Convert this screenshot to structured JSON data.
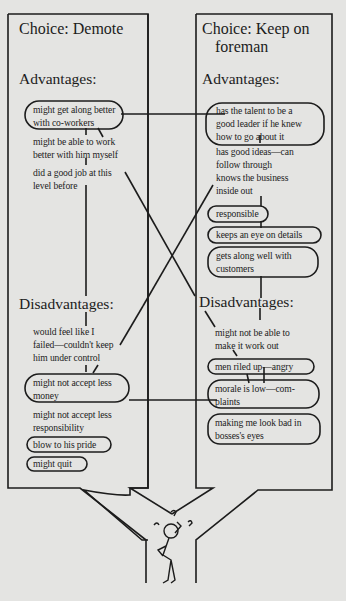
{
  "left": {
    "title": "Choice: Demote",
    "advantages_label": "Advantages:",
    "advantages": [
      {
        "lines": [
          "might get along better",
          "with co-workers"
        ],
        "circled": true
      },
      {
        "lines": [
          "might be able to work",
          "better with him myself"
        ],
        "circled": false
      },
      {
        "lines": [
          "did a good job at this",
          "level before"
        ],
        "circled": false
      }
    ],
    "disadvantages_label": "Disadvantages:",
    "disadvantages": [
      {
        "lines": [
          "would feel like I",
          "failed—couldn't keep",
          "him under control"
        ],
        "circled": false
      },
      {
        "lines": [
          "might not accept less",
          "money"
        ],
        "circled": true
      },
      {
        "lines": [
          "might not accept less",
          "responsibility"
        ],
        "circled": false
      },
      {
        "lines": [
          "blow to his pride"
        ],
        "circled": true
      },
      {
        "lines": [
          "might quit"
        ],
        "circled": true
      }
    ]
  },
  "right": {
    "title_line1": "Choice: Keep on",
    "title_line2": "foreman",
    "advantages_label": "Advantages:",
    "advantages": [
      {
        "lines": [
          "has the talent to be a",
          "good leader if he knew",
          "how to go about it"
        ],
        "circled": true
      },
      {
        "lines": [
          "has good ideas—can",
          "follow through"
        ],
        "circled": false
      },
      {
        "lines": [
          "knows the business",
          "inside out"
        ],
        "circled": false
      },
      {
        "lines": [
          "responsible"
        ],
        "circled": true
      },
      {
        "lines": [
          "keeps an eye on details"
        ],
        "circled": true
      },
      {
        "lines": [
          "gets along well with",
          "customers"
        ],
        "circled": true
      }
    ],
    "disadvantages_label": "Disadvantages:",
    "disadvantages": [
      {
        "lines": [
          "might not be able to",
          "make it work out"
        ],
        "circled": false
      },
      {
        "lines": [
          "men riled up—angry"
        ],
        "circled": true
      },
      {
        "lines": [
          "morale is low—com-",
          "plaints"
        ],
        "circled": true
      },
      {
        "lines": [
          "making me look bad in",
          "bosses's eyes"
        ],
        "circled": true
      }
    ]
  },
  "figure": {
    "icon": "confused-stick-figure",
    "marks": [
      "?",
      "?",
      "?"
    ]
  },
  "colors": {
    "paper": "#e4e4e2",
    "ink": "#1c1c1c"
  }
}
